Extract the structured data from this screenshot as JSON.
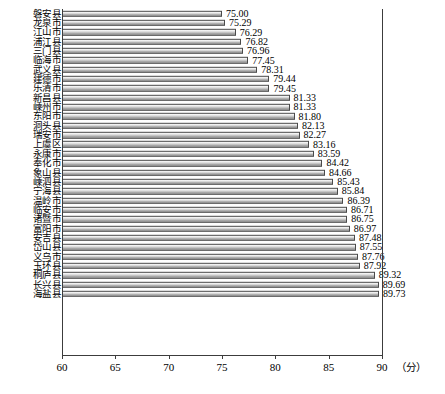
{
  "chart_data": {
    "type": "bar",
    "orientation": "horizontal",
    "title": "",
    "xlabel": "分",
    "ylabel": "",
    "xlim": [
      60,
      90
    ],
    "xticks": [
      60,
      65,
      70,
      75,
      80,
      85,
      90
    ],
    "grid": false,
    "legend": null,
    "bar_color": "#b9b9b9",
    "bar_edge_color": "#4a4a4a",
    "categories": [
      "磐安县",
      "龙泉市",
      "江山市",
      "浦江县",
      "三门县",
      "临海市",
      "武义县",
      "建德市",
      "乐清市",
      "新昌县",
      "嵊州市",
      "东阳市",
      "洞头县",
      "瑞安市",
      "上虞区",
      "永康市",
      "奉化市",
      "象山县",
      "嵊泗县",
      "宁海县",
      "温岭市",
      "临安市",
      "诸暨市",
      "富阳市",
      "安吉县",
      "岱山县",
      "义乌市",
      "玉环县",
      "桐庐县",
      "长兴县",
      "海盐县"
    ],
    "values": [
      75.0,
      75.29,
      76.29,
      76.82,
      76.96,
      77.45,
      78.31,
      79.44,
      79.45,
      81.33,
      81.33,
      81.8,
      82.13,
      82.27,
      83.16,
      83.59,
      84.42,
      84.66,
      85.43,
      85.84,
      86.39,
      86.71,
      86.75,
      86.97,
      87.48,
      87.55,
      87.76,
      87.92,
      89.32,
      89.69,
      89.73
    ],
    "value_labels": [
      "75.00",
      "75.29",
      "76.29",
      "76.82",
      "76.96",
      "77.45",
      "78.31",
      "79.44",
      "79.45",
      "81.33",
      "81.33",
      "81.80",
      "82.13",
      "82.27",
      "83.16",
      "83.59",
      "84.42",
      "84.66",
      "85.43",
      "85.84",
      "86.39",
      "86.71",
      "86.75",
      "86.97",
      "87.48",
      "87.55",
      "87.76",
      "87.92",
      "89.32",
      "89.69",
      "89.73"
    ],
    "tick_labels": [
      "60",
      "65",
      "70",
      "75",
      "80",
      "85",
      "90"
    ],
    "unit_label": "（分）"
  }
}
